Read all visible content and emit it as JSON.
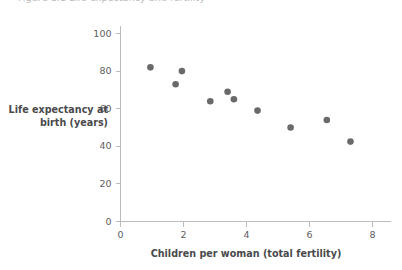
{
  "figure": {
    "cropped_title": "Figure 1.1 Life expectancy and fertility"
  },
  "chart_data": {
    "type": "scatter",
    "title": "",
    "xlabel": "Children per woman (total fertility)",
    "ylabel": "Life expectancy at birth (years)",
    "xlim": [
      0,
      8.6
    ],
    "ylim": [
      0,
      104
    ],
    "xticks": [
      0,
      2,
      4,
      6,
      8
    ],
    "xtick_labels": [
      "0",
      "2",
      "4",
      "6",
      "8"
    ],
    "yticks": [
      0,
      20,
      40,
      60,
      80,
      100
    ],
    "ytick_labels": [
      "0",
      "20",
      "40",
      "60",
      "80",
      "100"
    ],
    "grid": false,
    "legend": null,
    "marker_color": "#6a6a6c",
    "axis_color": "#bcbcbe",
    "marker_size": 4.6,
    "points": [
      {
        "x": 0.95,
        "y": 82
      },
      {
        "x": 1.75,
        "y": 73
      },
      {
        "x": 1.95,
        "y": 80
      },
      {
        "x": 2.85,
        "y": 64
      },
      {
        "x": 3.4,
        "y": 69
      },
      {
        "x": 3.6,
        "y": 65
      },
      {
        "x": 4.35,
        "y": 59
      },
      {
        "x": 5.4,
        "y": 50
      },
      {
        "x": 6.55,
        "y": 54
      },
      {
        "x": 7.3,
        "y": 42.5
      }
    ]
  }
}
